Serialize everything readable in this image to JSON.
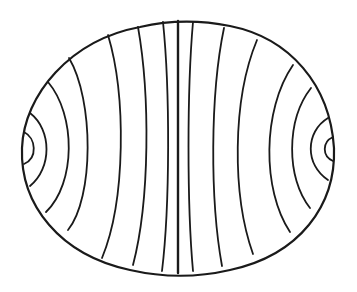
{
  "diagram": {
    "type": "field-lines-in-ellipse",
    "background": "#ffffff",
    "stroke_color": "#1a1a1a",
    "outline": {
      "path": "M22,148 C24,95 70,40 140,27 C170,20 200,20 230,26 C290,38 330,85 334,148 C336,205 300,255 230,270 C200,277 165,278 130,270 C60,255 20,205 22,148 Z",
      "stroke_width": 2.2
    },
    "field_lines": [
      {
        "id": "left-inner-arc",
        "path": "M24,132 C36,138 38,158 24,164",
        "w": 1.8
      },
      {
        "id": "left-arc-2",
        "path": "M30,113 C52,130 52,168 30,186",
        "w": 1.8
      },
      {
        "id": "left-arc-3",
        "path": "M48,82 C76,115 76,183 46,212",
        "w": 1.8
      },
      {
        "id": "left-arc-4",
        "path": "M69,58 C94,100 94,198 68,230",
        "w": 1.8
      },
      {
        "id": "line-5",
        "path": "M108,35 C126,95 126,200 102,258",
        "w": 1.8
      },
      {
        "id": "line-6",
        "path": "M138,27 C150,95 150,200 133,265",
        "w": 1.8
      },
      {
        "id": "line-7",
        "path": "M163,22 C170,90 170,205 162,271",
        "w": 1.8
      },
      {
        "id": "center-line",
        "path": "M178,21 C178,100 178,200 178,273",
        "w": 2.4
      },
      {
        "id": "line-9",
        "path": "M193,22 C187,90 187,205 193,271",
        "w": 1.8
      },
      {
        "id": "line-10",
        "path": "M224,28 C210,95 210,200 222,266",
        "w": 1.8
      },
      {
        "id": "line-11",
        "path": "M257,40 C232,100 232,195 253,254",
        "w": 1.8
      },
      {
        "id": "right-arc-4",
        "path": "M293,65 C262,110 262,190 290,232",
        "w": 1.8
      },
      {
        "id": "right-arc-3",
        "path": "M311,88 C286,120 286,178 310,208",
        "w": 1.8
      },
      {
        "id": "right-arc-2",
        "path": "M328,118 C305,132 305,165 328,180",
        "w": 1.8
      },
      {
        "id": "right-inner-arc",
        "path": "M333,137 C322,142 322,156 333,161",
        "w": 1.8
      }
    ]
  }
}
